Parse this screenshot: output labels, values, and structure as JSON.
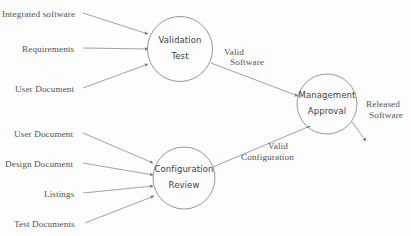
{
  "diagram": {
    "type": "data-flow-diagram",
    "background_color": "#fdfdfd",
    "stroke_color": "#8a8a8a",
    "text_color": "#555252",
    "nodes": [
      {
        "id": "validation-test",
        "line1": "Validation",
        "line2": "Test",
        "cx": 180,
        "cy": 49,
        "r": 32.5
      },
      {
        "id": "management-approval",
        "line1": "Management",
        "line2": "Approval",
        "cx": 327,
        "cy": 104,
        "r": 30
      },
      {
        "id": "configuration-review",
        "line1": "Configuration",
        "line2": "Review",
        "cx": 184,
        "cy": 178,
        "r": 31
      }
    ],
    "inputs": [
      {
        "id": "integrated-software",
        "label": "Integrated software",
        "lx": 2,
        "ly": 9,
        "x1": 83,
        "y1": 13,
        "x2": 148,
        "y2": 34
      },
      {
        "id": "requirements",
        "label": "Requirements",
        "lx": 22,
        "ly": 44,
        "x1": 83,
        "y1": 48,
        "x2": 148,
        "y2": 49
      },
      {
        "id": "user-document-top",
        "label": "User Document",
        "lx": 15,
        "ly": 84,
        "x1": 83,
        "y1": 88,
        "x2": 148,
        "y2": 64
      },
      {
        "id": "user-document-bottom",
        "label": "User Document",
        "lx": 14,
        "ly": 129,
        "x1": 83,
        "y1": 133,
        "x2": 153,
        "y2": 163
      },
      {
        "id": "design-document",
        "label": "Design Document",
        "lx": 5,
        "ly": 159,
        "x1": 83,
        "y1": 163,
        "x2": 153,
        "y2": 175
      },
      {
        "id": "listings",
        "label": "Listings",
        "lx": 44,
        "ly": 189,
        "x1": 83,
        "y1": 193,
        "x2": 153,
        "y2": 186
      },
      {
        "id": "test-documents",
        "label": "Test Documents",
        "lx": 14,
        "ly": 219,
        "x1": 85,
        "y1": 223,
        "x2": 154,
        "y2": 196
      }
    ],
    "flows": [
      {
        "id": "valid-software",
        "line1": "Valid",
        "line2": "Software",
        "l1x": 224,
        "l1y": 47,
        "l2x": 230,
        "l2y": 57,
        "x1": 211,
        "y1": 63,
        "x2": 298,
        "y2": 96
      },
      {
        "id": "valid-configuration",
        "line1": "Valid",
        "line2": "Configuration",
        "l1x": 268,
        "l1y": 141,
        "l2x": 241,
        "l2y": 152,
        "x1": 213,
        "y1": 167,
        "x2": 310,
        "y2": 126
      },
      {
        "id": "released-software",
        "line1": "Released",
        "line2": "Software",
        "l1x": 366,
        "l1y": 99,
        "l2x": 369,
        "l2y": 110,
        "x1": 352,
        "y1": 122,
        "x2": 366,
        "y2": 141
      }
    ]
  }
}
